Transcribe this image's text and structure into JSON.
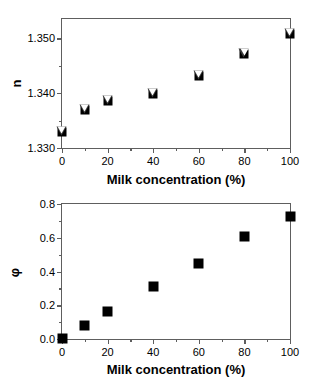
{
  "chart_data": [
    {
      "id": "refractive-index",
      "type": "scatter",
      "title": "",
      "xlabel": "Milk concentration (%)",
      "ylabel": "n",
      "xlim": [
        0,
        100
      ],
      "ylim": [
        1.33,
        1.3535
      ],
      "grid": false,
      "legend": "none",
      "x_ticks": [
        {
          "value": 0,
          "label": "0"
        },
        {
          "value": 20,
          "label": "20"
        },
        {
          "value": 40,
          "label": "40"
        },
        {
          "value": 60,
          "label": "60"
        },
        {
          "value": 80,
          "label": "80"
        },
        {
          "value": 100,
          "label": "100"
        }
      ],
      "x_minor_ticks": [
        10,
        30,
        50,
        70,
        90
      ],
      "y_ticks": [
        {
          "value": 1.33,
          "label": "1.330"
        },
        {
          "value": 1.34,
          "label": "1.340"
        },
        {
          "value": 1.35,
          "label": "1.350"
        }
      ],
      "y_minor_ticks": [
        1.335,
        1.345
      ],
      "marker_style": "filled-square-with-open-down-triangle",
      "x": [
        0,
        10,
        20,
        40,
        60,
        80,
        100
      ],
      "values": [
        1.333,
        1.337,
        1.3385,
        1.3398,
        1.3432,
        1.3472,
        1.3508
      ]
    },
    {
      "id": "volume-fraction",
      "type": "scatter",
      "title": "",
      "xlabel": "Milk concentration (%)",
      "ylabel": "φ",
      "xlim": [
        0,
        100
      ],
      "ylim": [
        0.0,
        0.8
      ],
      "grid": false,
      "legend": "none",
      "x_ticks": [
        {
          "value": 0,
          "label": "0"
        },
        {
          "value": 20,
          "label": "20"
        },
        {
          "value": 40,
          "label": "40"
        },
        {
          "value": 60,
          "label": "60"
        },
        {
          "value": 80,
          "label": "80"
        },
        {
          "value": 100,
          "label": "100"
        }
      ],
      "x_minor_ticks": [
        10,
        30,
        50,
        70,
        90
      ],
      "y_ticks": [
        {
          "value": 0.0,
          "label": "0.0"
        },
        {
          "value": 0.2,
          "label": "0.2"
        },
        {
          "value": 0.4,
          "label": "0.4"
        },
        {
          "value": 0.6,
          "label": "0.6"
        },
        {
          "value": 0.8,
          "label": "0.8"
        }
      ],
      "y_minor_ticks": [
        0.1,
        0.3,
        0.5,
        0.7
      ],
      "marker_style": "filled-square",
      "x": [
        0,
        10,
        20,
        40,
        60,
        80,
        100
      ],
      "values": [
        0.005,
        0.08,
        0.165,
        0.31,
        0.445,
        0.61,
        0.725
      ]
    }
  ],
  "colors": {
    "marker": "#000000",
    "axis": "#5e5e5e",
    "background": "#ffffff",
    "text": "#000000"
  }
}
